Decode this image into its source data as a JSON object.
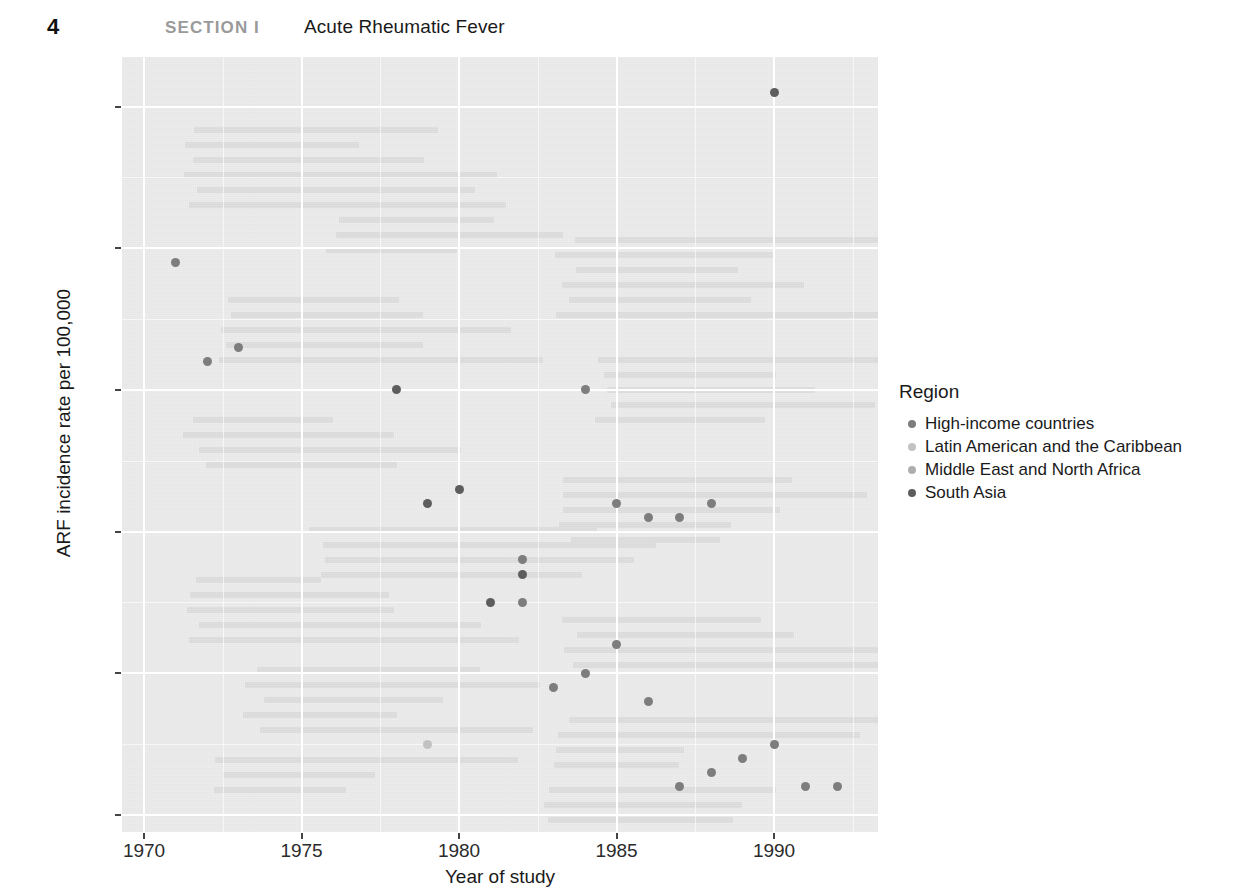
{
  "header": {
    "page_number": "4",
    "section_label": "SECTION I",
    "chapter_title": "Acute Rheumatic Fever"
  },
  "legend": {
    "title": "Region",
    "items": [
      {
        "label": "High-income countries",
        "color": "#7d7d7d"
      },
      {
        "label": "Latin American and the Caribbean",
        "color": "#c2c2c2"
      },
      {
        "label": "Middle East and North Africa",
        "color": "#aeaeae"
      },
      {
        "label": "South Asia",
        "color": "#5d5d5d"
      }
    ]
  },
  "axes": {
    "x_title": "Year of study",
    "y_title": "ARF incidence rate per 100,000",
    "x_ticks": [
      "1970",
      "1975",
      "1980",
      "1985",
      "1990"
    ],
    "y_ticks": [
      "0",
      "10",
      "20",
      "30",
      "40",
      "50"
    ]
  },
  "chart_data": {
    "type": "scatter",
    "title": "",
    "xlabel": "Year of study",
    "ylabel": "ARF incidence rate per 100,000",
    "xlim": [
      1969.3,
      1993.3
    ],
    "ylim": [
      -1.2,
      53.5
    ],
    "xticks": [
      1970,
      1975,
      1980,
      1985,
      1990
    ],
    "yticks": [
      0,
      10,
      20,
      30,
      40,
      50
    ],
    "grid": true,
    "legend_position": "right",
    "legend_title": "Region",
    "series": [
      {
        "name": "High-income countries",
        "color": "#7d7d7d",
        "points": [
          {
            "x": 1971,
            "y": 39
          },
          {
            "x": 1972,
            "y": 32
          },
          {
            "x": 1973,
            "y": 33
          },
          {
            "x": 1984,
            "y": 30
          },
          {
            "x": 1985,
            "y": 22
          },
          {
            "x": 1986,
            "y": 21
          },
          {
            "x": 1987,
            "y": 21
          },
          {
            "x": 1988,
            "y": 22
          },
          {
            "x": 1982,
            "y": 18
          },
          {
            "x": 1982,
            "y": 15
          },
          {
            "x": 1985,
            "y": 12
          },
          {
            "x": 1984,
            "y": 10
          },
          {
            "x": 1983,
            "y": 9
          },
          {
            "x": 1986,
            "y": 8
          },
          {
            "x": 1990,
            "y": 5
          },
          {
            "x": 1989,
            "y": 4
          },
          {
            "x": 1988,
            "y": 3
          },
          {
            "x": 1987,
            "y": 2
          },
          {
            "x": 1991,
            "y": 2
          },
          {
            "x": 1992,
            "y": 2
          }
        ]
      },
      {
        "name": "Latin American and the Caribbean",
        "color": "#c2c2c2",
        "points": [
          {
            "x": 1979,
            "y": 5
          }
        ]
      },
      {
        "name": "Middle East and North Africa",
        "color": "#aeaeae",
        "points": []
      },
      {
        "name": "South Asia",
        "color": "#5d5d5d",
        "points": [
          {
            "x": 1990,
            "y": 51
          },
          {
            "x": 1978,
            "y": 30
          },
          {
            "x": 1980,
            "y": 23
          },
          {
            "x": 1979,
            "y": 22
          },
          {
            "x": 1982,
            "y": 17
          },
          {
            "x": 1981,
            "y": 15
          }
        ]
      }
    ]
  }
}
